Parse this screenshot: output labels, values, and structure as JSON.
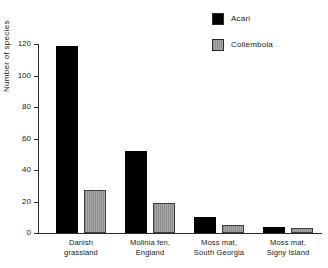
{
  "chart_data": {
    "type": "bar",
    "title": "",
    "xlabel": "",
    "ylabel": "Number of species",
    "ylim": [
      0,
      120
    ],
    "yticks": [
      0,
      20,
      40,
      60,
      80,
      100,
      120
    ],
    "ytick_labels": [
      "0",
      "20",
      "40",
      "60",
      "80",
      "100",
      "120"
    ],
    "grid": false,
    "legend_position": "top-right",
    "categories": [
      "Danish grassland",
      "Molinia fen, England",
      "Moss mat, South Georgia",
      "Moss mat, Signy Island"
    ],
    "category_lines": [
      [
        "Danish",
        "grassland"
      ],
      [
        "Molinia fen,",
        "England"
      ],
      [
        "Moss mat,",
        "South Georgia"
      ],
      [
        "Moss mat,",
        "Signy Island"
      ]
    ],
    "series": [
      {
        "name": "Acari",
        "color": "#000000",
        "values": [
          119,
          52,
          10,
          4
        ]
      },
      {
        "name": "Collembola",
        "color": "#9a9a9a",
        "values": [
          27,
          19,
          5,
          3
        ]
      }
    ]
  },
  "legend": {
    "items": [
      {
        "label": "Acari",
        "swatch": "black-square-icon"
      },
      {
        "label": "Collembola",
        "swatch": "gray-hatched-square-icon"
      }
    ]
  },
  "axes": {
    "y_label": "Number of species",
    "y_tick_0": "0",
    "y_tick_1": "20",
    "y_tick_2": "40",
    "y_tick_3": "60",
    "y_tick_4": "80",
    "y_tick_5": "100",
    "y_tick_6": "120"
  },
  "categories": {
    "c0_line1": "Danish",
    "c0_line2": "grassland",
    "c1_line1": "Molinia fen,",
    "c1_line2": "England",
    "c2_line1": "Moss mat,",
    "c2_line2": "South Georgia",
    "c3_line1": "Moss mat,",
    "c3_line2": "Signy Island"
  },
  "colors": {
    "acari": "#000000",
    "collembola": "#9a9a9a",
    "axis": "#2b2b2b",
    "background": "#ffffff",
    "text": "#1a1a1a"
  }
}
